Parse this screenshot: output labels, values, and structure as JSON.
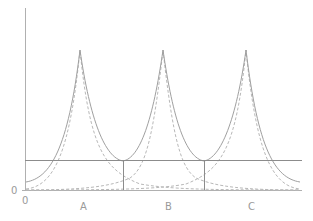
{
  "diagram": {
    "type": "overlapping-peak-curves",
    "y_axis_zero_label": "0",
    "x_axis_zero_label": "0",
    "peak_labels": [
      "A",
      "B",
      "C"
    ],
    "colors": {
      "axis": "#b0b0b0",
      "solid_curve": "#a0a0a0",
      "dashed_curve": "#b8b8b8",
      "threshold_line": "#8c8c8c",
      "label": "#9a9a9a"
    },
    "legend": []
  }
}
